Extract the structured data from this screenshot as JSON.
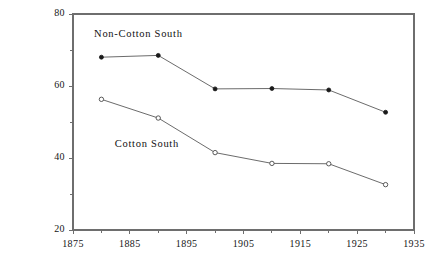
{
  "chart_data": {
    "type": "line",
    "title": "",
    "xlabel": "",
    "ylabel": "Percent of All Farms Owner-Operated",
    "xlim": [
      1875,
      1935
    ],
    "ylim": [
      20,
      80
    ],
    "xticks": [
      1875,
      1885,
      1895,
      1905,
      1915,
      1925,
      1935
    ],
    "xtick_labels": [
      "1875",
      "1885",
      "1895",
      "1905",
      "1915",
      "1925",
      "1935"
    ],
    "x_minor_ticks": [
      1880,
      1890,
      1900,
      1910,
      1920,
      1930
    ],
    "yticks": [
      20,
      40,
      60,
      80
    ],
    "ytick_labels": [
      "20",
      "40",
      "60",
      "80"
    ],
    "y_minor_ticks": [
      30,
      50,
      70
    ],
    "grid": false,
    "legend_position": "inline-annotation",
    "x": [
      1880,
      1890,
      1900,
      1910,
      1920,
      1930
    ],
    "series": [
      {
        "name": "Non-Cotton South",
        "marker": "filled-circle",
        "values": [
          68.0,
          68.5,
          59.2,
          59.3,
          58.9,
          52.7
        ],
        "label_x": 1886.5,
        "label_y": 74.2
      },
      {
        "name": "Cotton South",
        "marker": "open-circle",
        "values": [
          56.3,
          51.1,
          41.5,
          38.5,
          38.4,
          32.6
        ],
        "label_x": 1888.0,
        "label_y": 43.6
      }
    ]
  },
  "annotations": {
    "non_cotton_label": "Non-Cotton South",
    "cotton_label": "Cotton South"
  }
}
